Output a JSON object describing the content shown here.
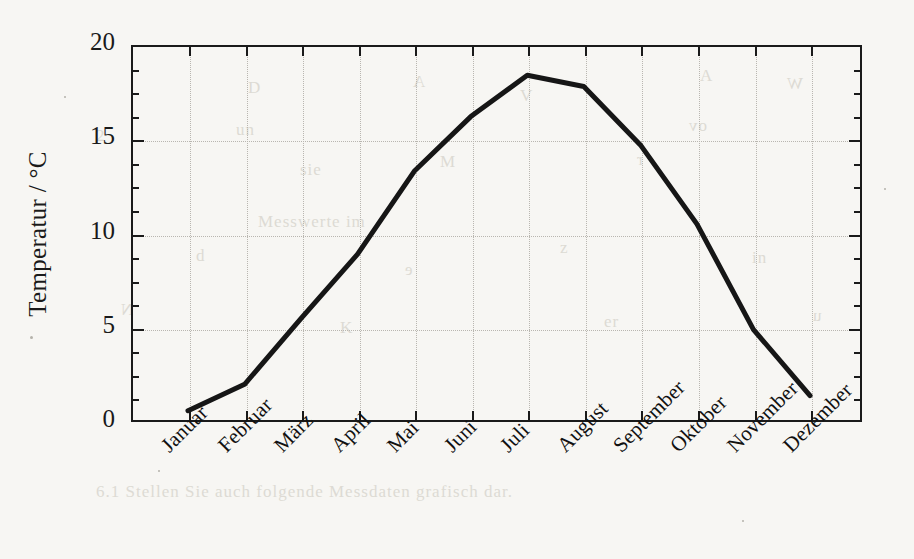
{
  "figure": {
    "caption_visible": false,
    "background_color": "#f7f6f3",
    "line_color": "#161616",
    "frame_color": "#1a1a1a",
    "grid_color": "#b9b6b0"
  },
  "axes": {
    "y": {
      "label": "Temperatur / °C",
      "ticks": [
        "0",
        "5",
        "10",
        "15",
        "20"
      ],
      "min": 0,
      "max": 20
    },
    "x": {
      "label": "",
      "ticks": [
        "Januar",
        "Februar",
        "März",
        "April",
        "Mai",
        "Juni",
        "Juli",
        "August",
        "September",
        "Oktober",
        "November",
        "Dezember"
      ]
    }
  },
  "bleed_text": [
    {
      "text": "D",
      "left": 248,
      "top": 78
    },
    {
      "text": "A",
      "left": 412,
      "top": 72
    },
    {
      "text": "V",
      "left": 520,
      "top": 86
    },
    {
      "text": "A",
      "left": 700,
      "top": 66
    },
    {
      "text": "W",
      "left": 786,
      "top": 74
    },
    {
      "text": "2",
      "left": 96,
      "top": 126
    },
    {
      "text": "un",
      "left": 236,
      "top": 120
    },
    {
      "text": "ov",
      "left": 688,
      "top": 116
    },
    {
      "text": "sie",
      "left": 300,
      "top": 160
    },
    {
      "text": "M",
      "left": 440,
      "top": 152
    },
    {
      "text": "r",
      "left": 636,
      "top": 150
    },
    {
      "text": "Messwerte im",
      "left": 258,
      "top": 212
    },
    {
      "text": "d",
      "left": 196,
      "top": 246
    },
    {
      "text": "e",
      "left": 404,
      "top": 260
    },
    {
      "text": "z",
      "left": 560,
      "top": 238
    },
    {
      "text": "in",
      "left": 752,
      "top": 248
    },
    {
      "text": "N",
      "left": 120,
      "top": 300
    },
    {
      "text": "K",
      "left": 340,
      "top": 318
    },
    {
      "text": "er",
      "left": 604,
      "top": 312
    },
    {
      "text": "u",
      "left": 812,
      "top": 306
    },
    {
      "text": "6.1 Stellen Sie auch folgende Messdaten grafisch dar.",
      "left": 96,
      "top": 482
    }
  ],
  "chart_data": {
    "type": "line",
    "title": "",
    "xlabel": "",
    "ylabel": "Temperatur / °C",
    "categories": [
      "Januar",
      "Februar",
      "März",
      "April",
      "Mai",
      "Juni",
      "Juli",
      "August",
      "September",
      "Oktober",
      "November",
      "Dezember"
    ],
    "values": [
      0.6,
      2.0,
      5.5,
      8.9,
      13.3,
      16.2,
      18.4,
      17.8,
      14.7,
      10.5,
      4.9,
      1.4
    ],
    "ylim": [
      0,
      20
    ],
    "yticks": [
      0,
      5,
      10,
      15,
      20
    ],
    "yminor_step": 1.25,
    "grid": true,
    "grid_style": "dotted",
    "legend": "none",
    "markers": "none",
    "line_width_px": 5,
    "line_color": "#161616"
  }
}
